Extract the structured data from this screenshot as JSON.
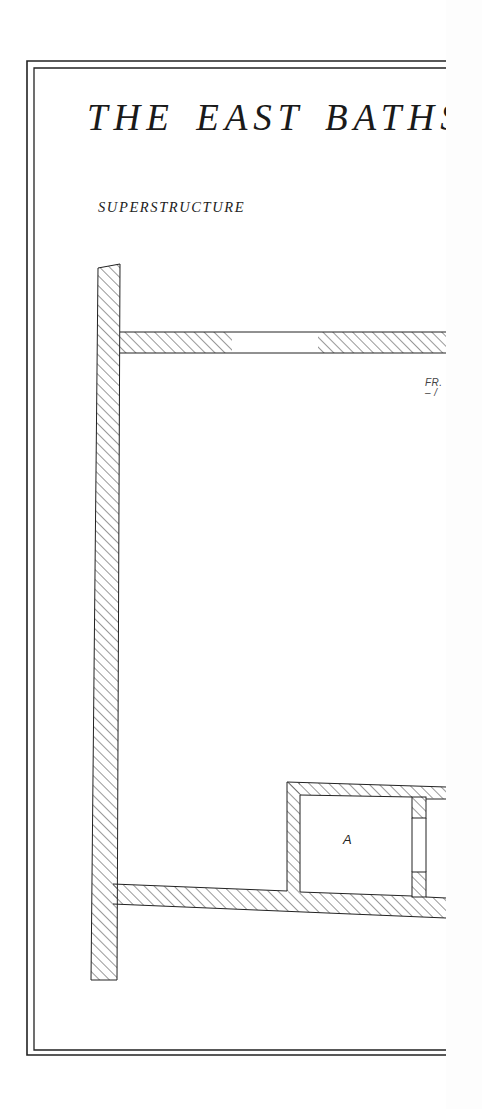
{
  "plate": {
    "title": "THE EAST BATHS",
    "subtitle": "SUPERSTRUCTURE",
    "note_line1": "FR.",
    "note_line2": "– /",
    "rooms": [
      {
        "label": "A"
      }
    ]
  },
  "colors": {
    "ink": "#1a1a1a",
    "paper": "#ffffff"
  }
}
